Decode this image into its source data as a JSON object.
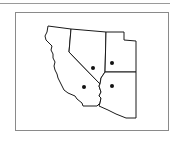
{
  "map": {
    "type": "outline-map",
    "region": "Southwestern United States",
    "states": [
      {
        "name": "California",
        "has_marker": true
      },
      {
        "name": "Nevada",
        "has_marker": true
      },
      {
        "name": "Utah",
        "has_marker": true
      },
      {
        "name": "Arizona",
        "has_marker": true
      }
    ],
    "marker_count": 4,
    "colors": {
      "outline": "#1a1a1a",
      "fill": "#ffffff",
      "frame": "#8a8a8a",
      "marker": "#111111"
    }
  }
}
